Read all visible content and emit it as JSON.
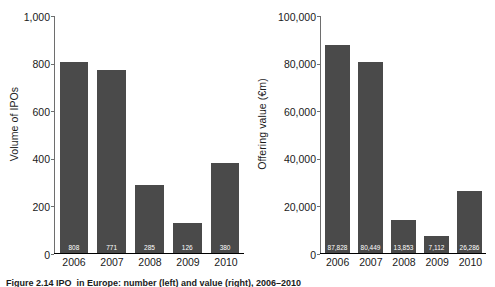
{
  "chart_data": [
    {
      "type": "bar",
      "panel": "left",
      "title": "",
      "xlabel": "",
      "ylabel": "Volume of IPOs",
      "categories": [
        "2006",
        "2007",
        "2008",
        "2009",
        "2010"
      ],
      "values": [
        808,
        771,
        285,
        126,
        380
      ],
      "value_labels": [
        "808",
        "771",
        "285",
        "126",
        "380"
      ],
      "yticks": [
        0,
        200,
        400,
        600,
        800,
        1000
      ],
      "ytick_labels": [
        "0",
        "200",
        "400",
        "600",
        "800",
        "1,000"
      ],
      "ylim": [
        0,
        1000
      ],
      "grid": false,
      "legend": "none",
      "bar_color": "#4a4a4a",
      "value_label_color": "#ffffff"
    },
    {
      "type": "bar",
      "panel": "right",
      "title": "",
      "xlabel": "",
      "ylabel": "Offering value (€m)",
      "categories": [
        "2006",
        "2007",
        "2008",
        "2009",
        "2010"
      ],
      "values": [
        87828,
        80449,
        13853,
        7112,
        26286
      ],
      "value_labels": [
        "87,828",
        "80,449",
        "13,853",
        "7,112",
        "26,286"
      ],
      "yticks": [
        0,
        20000,
        40000,
        60000,
        80000,
        100000
      ],
      "ytick_labels": [
        "0",
        "20,000",
        "40,000",
        "60,000",
        "80,000",
        "100,000"
      ],
      "ylim": [
        0,
        100000
      ],
      "grid": false,
      "legend": "none",
      "bar_color": "#4a4a4a",
      "value_label_color": "#ffffff"
    }
  ],
  "caption": {
    "text": "Figure 2.14  IPO  in Europe: number (left) and value (right), 2006–2010"
  }
}
